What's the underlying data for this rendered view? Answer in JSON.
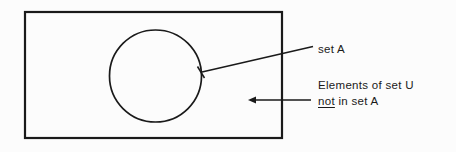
{
  "figure": {
    "background_color": "#fcfcfc",
    "ink_color": "#1a1a1a"
  },
  "shapes": {
    "universal_set_rectangle": {
      "name": "universal set U",
      "x": 24,
      "y": 11,
      "width": 259,
      "height": 128,
      "stroke_width": 2,
      "fill": "none"
    },
    "set_a_circle": {
      "name": "set A",
      "cx": 155.5,
      "cy": 76,
      "r": 46,
      "stroke_width": 1.6,
      "fill": "none"
    }
  },
  "annotations": {
    "set_a": {
      "text": "set A",
      "leader_from_x": 201,
      "leader_from_y": 72,
      "leader_to_x": 313,
      "leader_to_y": 47,
      "arrow_direction": "points-left-to-circle-edge"
    },
    "complement": {
      "line1": "Elements of set U",
      "line2_emphasis": "not",
      "line2_rest": " in set A",
      "leader_from_x": 249,
      "leader_from_y": 100,
      "leader_to_x": 311,
      "leader_to_y": 100,
      "arrow_direction": "points-left-into-rectangle"
    }
  }
}
